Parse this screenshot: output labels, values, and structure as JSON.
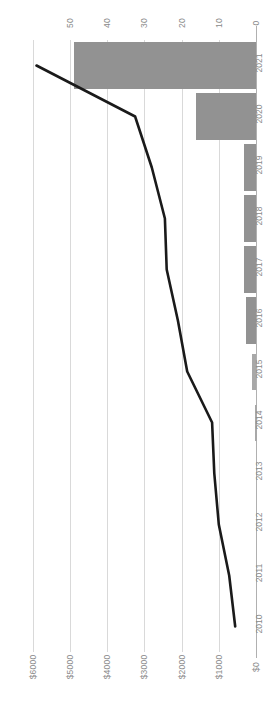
{
  "chart_data": {
    "type": "bar",
    "orientation": "horizontal",
    "title": "",
    "subtitle": "",
    "xlabel": "",
    "ylabel": "",
    "grid": true,
    "legend": false,
    "categories": [
      "2021",
      "2020",
      "2019",
      "2018",
      "2017",
      "2016",
      "2015",
      "2014",
      "2013",
      "2012",
      "2011",
      "2010"
    ],
    "axes": {
      "bar_axis": {
        "position": "top",
        "tick_labels": [
          "50",
          "40",
          "30",
          "20",
          "10",
          "0"
        ],
        "ticks": [
          50,
          40,
          30,
          20,
          10,
          0
        ],
        "range": [
          0,
          55
        ],
        "direction": "right-to-left"
      },
      "value_axis": {
        "position": "bottom",
        "tick_labels": [
          "$6000",
          "$5000",
          "$4000",
          "$3000",
          "$2000",
          "$1000",
          "$0"
        ],
        "ticks": [
          6000,
          5000,
          4000,
          3000,
          2000,
          1000,
          0
        ],
        "range": [
          0,
          6600
        ],
        "direction": "right-to-left"
      }
    },
    "series": [
      {
        "name": "Bars",
        "type": "bar",
        "axis": "bar_axis",
        "color": "#929292",
        "values": [
          49.0,
          16.0,
          3.2,
          3.2,
          3.2,
          2.6,
          1.0,
          0.25,
          0.0,
          0.0,
          0.0,
          0.0
        ]
      },
      {
        "name": "Line",
        "type": "line",
        "axis": "value_axis",
        "color": "#1a1a1a",
        "values": [
          5900,
          3250,
          2800,
          2450,
          2400,
          2100,
          1850,
          1180,
          1120,
          1000,
          720,
          560
        ]
      }
    ]
  },
  "colors": {
    "bar_fill": "#929292",
    "line_stroke": "#1a1a1a",
    "gridline": "#d9d9d9",
    "axis_line": "#b0b0b0",
    "tick_text": "#8a8a8a",
    "background": "#ffffff"
  }
}
